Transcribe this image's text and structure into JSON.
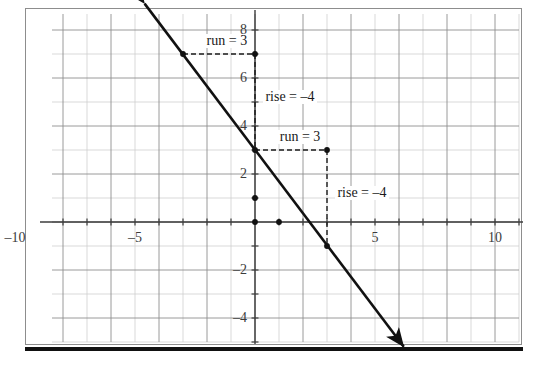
{
  "chart_data": {
    "type": "line",
    "title": "",
    "xlabel": "",
    "ylabel": "",
    "xlim": [
      -11.5,
      11.5
    ],
    "ylim": [
      -5.5,
      9.0
    ],
    "grid": true,
    "minor_grid_step": 1,
    "major_grid_step": 2,
    "legend_position": "none",
    "x_ticks": [
      -10,
      -5,
      5,
      10
    ],
    "x_tick_labels": [
      "–10",
      "–5",
      "5",
      "10"
    ],
    "y_ticks": [
      8,
      6,
      4,
      2,
      -2,
      -4
    ],
    "y_tick_labels": [
      "8",
      "6",
      "4",
      "2",
      "–2",
      "–4"
    ],
    "series": [
      {
        "name": "line",
        "type": "line",
        "equation": "y = -4/3 x + 3",
        "slope": -1.3333,
        "y_intercept": 3,
        "x_intercept": 2.25,
        "arrow_start": [
          -4.6,
          9.1
        ],
        "arrow_end": [
          6.2,
          -5.2
        ],
        "color": "#111111",
        "width": 2.6,
        "arrows": "both"
      }
    ],
    "points": [
      {
        "x": -3,
        "y": 7,
        "label": ""
      },
      {
        "x": 0,
        "y": 7,
        "label": ""
      },
      {
        "x": 0,
        "y": 3,
        "label": ""
      },
      {
        "x": 3,
        "y": 3,
        "label": ""
      },
      {
        "x": 3,
        "y": -1,
        "label": ""
      },
      {
        "x": 0,
        "y": 1,
        "label": ""
      },
      {
        "x": 0,
        "y": 0,
        "label": ""
      },
      {
        "x": 1,
        "y": 0,
        "label": ""
      }
    ],
    "slope_triangles": [
      {
        "from": [
          -3,
          7
        ],
        "corner": [
          0,
          7
        ],
        "to": [
          0,
          3
        ],
        "run_label": "run = 3",
        "rise_label": "rise = –4",
        "run": 3,
        "rise": -4
      },
      {
        "from": [
          0,
          3
        ],
        "corner": [
          3,
          3
        ],
        "to": [
          3,
          -1
        ],
        "run_label": "run = 3",
        "rise_label": "rise = –4",
        "run": 3,
        "rise": -4
      }
    ],
    "annotations": [
      {
        "text": "run = 3",
        "x": -2.1,
        "y": 7.55
      },
      {
        "text": "rise = –4",
        "x": 0.35,
        "y": 5.2
      },
      {
        "text": "run = 3",
        "x": 0.95,
        "y": 3.55
      },
      {
        "text": "rise = –4",
        "x": 3.35,
        "y": 1.2
      }
    ],
    "colors": {
      "line": "#111111",
      "minor_grid": "#cfcfcf",
      "major_grid": "#8f8f8f",
      "axis": "#3c3c3c",
      "dashed": "#1a1a1a",
      "tick_text": "#3c3c3c",
      "frame": "#8d8d8d",
      "rule": "#111111",
      "background": "#ffffff"
    }
  },
  "figure": {
    "has_outer_frame": true,
    "has_bottom_rule": true
  }
}
